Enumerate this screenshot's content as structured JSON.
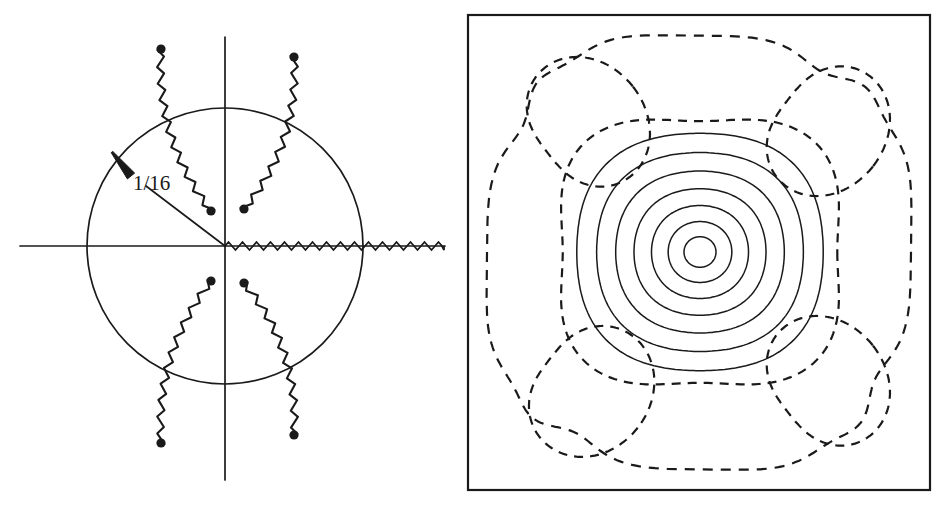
{
  "figure": {
    "background": "#ffffff",
    "ink": "#1a1a1a",
    "width": 950,
    "height": 510,
    "panels": [
      "branch-cut-complex-plane",
      "contour-plot"
    ]
  },
  "left_panel": {
    "name": "branch-cut-complex-plane",
    "annotation_label": "1/16",
    "unit_circle": {
      "cx": 225,
      "cy": 246,
      "r": 138
    },
    "real_axis": {
      "x1": 20,
      "y1": 246,
      "x2": 445,
      "y2": 246
    },
    "imag_axis": {
      "x1": 225,
      "y1": 37,
      "x2": 225,
      "y2": 480
    },
    "radius_line": {
      "x1": 225,
      "y1": 246,
      "x2": 146,
      "y2": 186
    },
    "arrow_tip": {
      "x": 112,
      "y": 152
    },
    "arrow_tail": {
      "x": 131,
      "y": 176
    },
    "label_pos": {
      "x": 133,
      "y": 190
    },
    "real_branch_cut": {
      "x_start": 225,
      "x_end": 444,
      "y": 246,
      "amplitude": 4,
      "period": 7
    },
    "radial_branch_cuts": [
      {
        "id": "upper-left",
        "x1": 161,
        "y1": 49,
        "x2": 211,
        "y2": 211,
        "bow": 16
      },
      {
        "id": "upper-right",
        "x1": 294,
        "y1": 57,
        "x2": 244,
        "y2": 209,
        "bow": -16
      },
      {
        "id": "lower-left",
        "x1": 161,
        "y1": 443,
        "x2": 211,
        "y2": 281,
        "bow": -16
      },
      {
        "id": "lower-right",
        "x1": 294,
        "y1": 435,
        "x2": 244,
        "y2": 283,
        "bow": 16
      }
    ]
  },
  "chart_data": {
    "type": "heatmap",
    "title": "",
    "xlabel": "",
    "ylabel": "",
    "grid": false,
    "legend": "none",
    "frame": {
      "x": 468,
      "y": 15,
      "width": 462,
      "height": 475
    },
    "center": {
      "x": 700,
      "y": 252
    },
    "solid_contour_count": 7,
    "solid_contour_radii_x": [
      16,
      32,
      49,
      67,
      86,
      106,
      127
    ],
    "solid_contour_radii_y": [
      15,
      30,
      46,
      63,
      81,
      100,
      120
    ],
    "dashed_center_ring_radius_x": 150,
    "dashed_center_ring_radius_y": 143,
    "dashed_corner_lobe_count": 4,
    "dashed_outer_boundary": true,
    "series": [
      {
        "name": "solid-contours",
        "style": "solid",
        "count": 7,
        "role": "central peak levels"
      },
      {
        "name": "dashed-contours",
        "style": "dashed",
        "count": 6,
        "role": "negative/secondary levels"
      }
    ]
  }
}
